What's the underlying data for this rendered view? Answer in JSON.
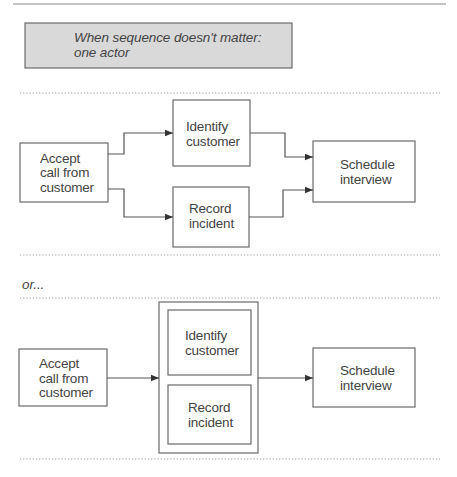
{
  "callout": {
    "line1": "When sequence doesn't matter:",
    "line2": "one actor"
  },
  "separator_label": "or...",
  "diagram_a": {
    "accept": [
      "Accept",
      "call from",
      "customer"
    ],
    "identify": [
      "Identify",
      "customer"
    ],
    "record": [
      "Record",
      "incident"
    ],
    "schedule": [
      "Schedule",
      "interview"
    ]
  },
  "diagram_b": {
    "accept": [
      "Accept",
      "call from",
      "customer"
    ],
    "identify": [
      "Identify",
      "customer"
    ],
    "record": [
      "Record",
      "incident"
    ],
    "schedule": [
      "Schedule",
      "interview"
    ]
  },
  "colors": {
    "callout_fill": "#d9d9d9",
    "stroke": "#6a6a6a",
    "text": "#444444"
  }
}
